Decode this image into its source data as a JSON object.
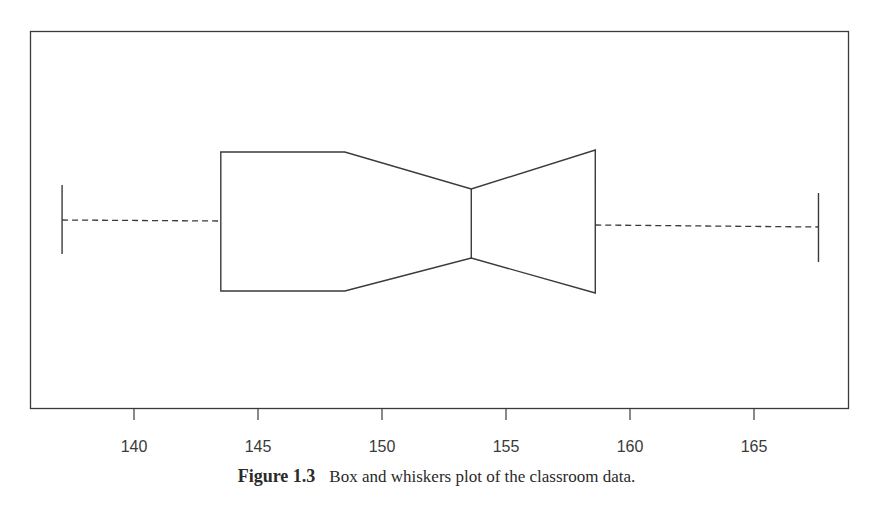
{
  "chart_data": {
    "type": "boxplot",
    "orientation": "horizontal",
    "notched": true,
    "title": "",
    "xlabel": "",
    "ylabel": "",
    "xlim": [
      135.9,
      168.8
    ],
    "x_ticks": [
      140,
      145,
      150,
      155,
      160,
      165
    ],
    "x_tick_labels": [
      "140",
      "145",
      "150",
      "155",
      "160",
      "165"
    ],
    "grid": false,
    "legend": null,
    "series": [
      {
        "name": "classroom data",
        "whisker_low": 137.1,
        "q1": 143.5,
        "notch_low": 148.5,
        "median": 153.6,
        "notch_high": 158.6,
        "q3": 158.6,
        "whisker_high": 167.6
      }
    ]
  },
  "caption": {
    "figure_number": "Figure 1.3",
    "text": "Box and whiskers plot of the classroom data."
  },
  "colors": {
    "line": "#3a3a3a",
    "background": "#ffffff"
  }
}
